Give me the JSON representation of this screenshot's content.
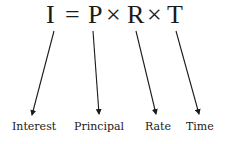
{
  "formula": {
    "variable_I": "I",
    "equals": "=",
    "variable_P": "P",
    "times_1": "×",
    "variable_R": "R",
    "times_2": "×",
    "variable_T": "T"
  },
  "labels": {
    "interest": "Interest",
    "principal": "Principal",
    "rate": "Rate",
    "time": "Time"
  },
  "colors": {
    "ink": "#1a1a1a",
    "background": "#ffffff"
  }
}
